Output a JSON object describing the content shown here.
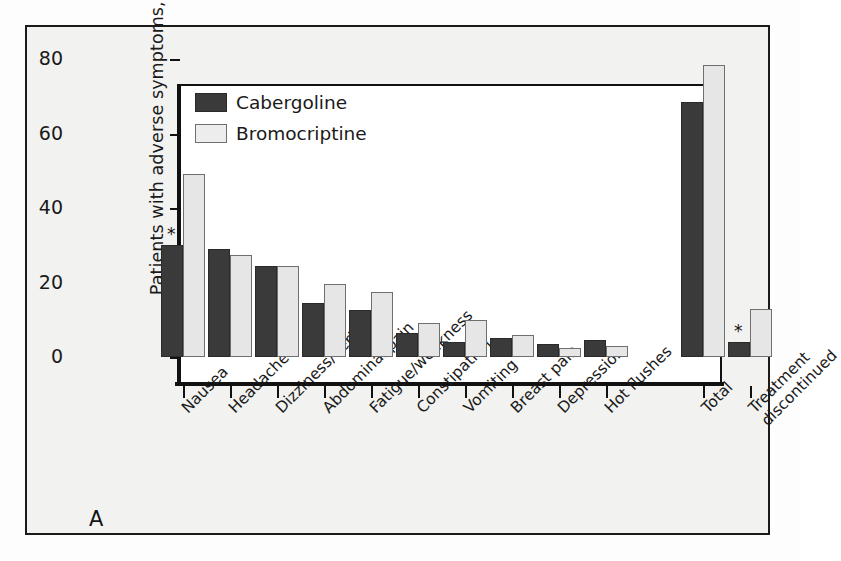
{
  "figure": {
    "panel_label": "A",
    "legend_position": "top-left",
    "colors": {
      "cabergoline": "#3a3a3a",
      "bromocriptine": "#e6e6e6",
      "axis": "#111111",
      "background": "#f2f2f0"
    },
    "annotation_symbol": "*"
  },
  "chart_data": {
    "type": "bar",
    "title": "",
    "xlabel": "",
    "ylabel": "Patients with adverse symptoms, %",
    "ylim": [
      0,
      80
    ],
    "yticks": [
      0,
      20,
      40,
      60,
      80
    ],
    "grid": false,
    "legend": [
      "Cabergoline",
      "Bromocriptine"
    ],
    "categories": [
      "Nausea",
      "Headache",
      "Dizziness/vertigo",
      "Abdominal pain",
      "Fatigue/weakness",
      "Constipation",
      "Vomiting",
      "Breast pain",
      "Depression",
      "Hot flushes",
      "Total",
      "Treatment discontinued"
    ],
    "series": [
      {
        "name": "Cabergoline",
        "values": [
          30,
          29,
          24.5,
          14.5,
          12.5,
          6.5,
          4,
          5,
          3.5,
          4.5,
          68.5,
          4
        ]
      },
      {
        "name": "Bromocriptine",
        "values": [
          49,
          27.5,
          24.5,
          19.5,
          17.5,
          9,
          10,
          6,
          2.5,
          3,
          78.5,
          13
        ]
      }
    ],
    "annotations": [
      {
        "category": "Nausea",
        "series": "Cabergoline",
        "symbol": "*"
      },
      {
        "category": "Treatment discontinued",
        "series": "Cabergoline",
        "symbol": "*"
      }
    ]
  }
}
